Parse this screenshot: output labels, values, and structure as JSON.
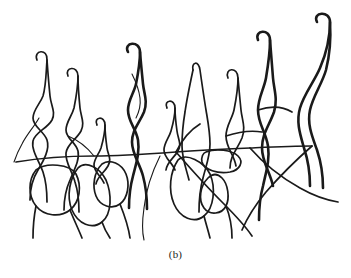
{
  "figure": {
    "caption": "(b)",
    "kind": "line-drawing",
    "background_color": "#ffffff",
    "ink_color": "#1a1a1a",
    "canvas": {
      "width": 351,
      "height": 278
    },
    "drawing_bounds": {
      "x": 14,
      "y": 18,
      "width": 326,
      "height": 222
    }
  },
  "chart_data": {
    "type": "line",
    "title": "(b)",
    "xlabel": "",
    "ylabel": "",
    "grid": false,
    "legend": null,
    "xlim": [
      0,
      351
    ],
    "ylim": [
      278,
      0
    ],
    "stroke_color": "#1a1a1a",
    "stroke_widths": {
      "thin": 1.1,
      "medium": 1.7,
      "thick": 2.6
    },
    "series": [
      {
        "name": "filament-1",
        "width": "medium",
        "points": "M37,60 C33,50 48,48 47,60 C46,74 46,86 43,96 C40,104 33,110 33,118 C33,127 44,131 47,140 C50,149 44,160 38,170 C33,178 30,188 30,200"
      },
      {
        "name": "filament-1b",
        "width": "medium",
        "points": "M47,60 C48,74 49,86 50,96 C51,106 56,112 52,120 C47,129 35,132 33,141 C31,150 39,161 43,172 C46,181 47,190 47,202"
      },
      {
        "name": "filament-1-tail",
        "width": "thin",
        "points": "M39,118 C34,127 27,134 22,144 C18,151 16,156 14,162"
      },
      {
        "name": "filament-2",
        "width": "medium",
        "points": "M68,76 C64,67 78,65 78,76 C78,88 76,98 74,108 C72,116 66,122 66,130 C66,139 76,142 78,151 C80,160 74,170 70,180 C66,189 64,198 64,210"
      },
      {
        "name": "filament-2b",
        "width": "medium",
        "points": "M78,76 C78,88 79,98 80,108 C81,117 85,123 81,131 C76,140 67,144 66,153 C65,162 72,171 75,182 C78,191 79,200 79,212"
      },
      {
        "name": "filament-3",
        "width": "medium",
        "points": "M97,125 C93,117 105,115 105,125 C105,134 103,141 101,148 C99,154 94,159 94,165 C94,172 101,176 104,183"
      },
      {
        "name": "filament-3b",
        "width": "medium",
        "points": "M105,125 C105,134 106,141 107,148 C108,155 112,159 108,166 C104,173 97,177 96,184"
      },
      {
        "name": "filament-4",
        "width": "thick",
        "points": "M128,52 C123,42 140,40 140,52 C140,64 138,74 136,84 C134,93 128,100 128,110 C128,122 136,128 138,140 C140,152 136,164 133,176 C130,187 129,196 129,208"
      },
      {
        "name": "filament-4b",
        "width": "thick",
        "points": "M140,52 C141,64 142,74 143,84 C144,94 148,101 144,112 C139,124 132,130 132,142 C132,154 140,164 143,176 C146,187 147,197 147,209"
      },
      {
        "name": "filament-4-inner",
        "width": "thin",
        "points": "M132,74 C136,82 139,90 140,98 C141,106 139,112 136,118"
      },
      {
        "name": "filament-5",
        "width": "medium",
        "points": "M167,108 C163,100 175,98 175,108 C175,117 173,124 171,131 C169,138 164,143 164,150 C164,158 172,162 175,170"
      },
      {
        "name": "filament-5b",
        "width": "medium",
        "points": "M175,108 C175,117 176,124 177,131 C178,139 182,144 178,151 C174,158 167,162 166,170"
      },
      {
        "name": "filament-6",
        "width": "medium",
        "points": "M193,70 C191,62 199,60 200,70 C202,84 204,98 206,110 C208,122 210,132 210,144 C210,156 206,166 203,178 C200,189 199,198 199,212"
      },
      {
        "name": "filament-6b",
        "width": "medium",
        "points": "M193,70 C190,84 187,98 185,112 C183,124 182,134 182,146 C182,158 186,168 189,180"
      },
      {
        "name": "filament-7",
        "width": "medium",
        "points": "M228,78 C224,68 238,66 238,78 C238,90 236,100 234,110 C232,119 226,126 226,136 C226,148 234,154 236,166"
      },
      {
        "name": "filament-7b",
        "width": "medium",
        "points": "M238,78 C239,90 240,100 241,110 C242,120 246,127 242,138 C237,150 230,156 230,168"
      },
      {
        "name": "filament-8",
        "width": "thick",
        "points": "M258,40 C254,30 270,28 270,40 C270,54 268,66 266,78 C264,89 258,98 258,110 C258,124 266,132 268,146 C270,160 266,172 263,186 C260,197 259,206 259,220"
      },
      {
        "name": "filament-8b",
        "width": "thick",
        "points": "M270,40 C271,54 272,66 273,78 C274,90 278,99 274,112 C269,126 262,134 262,148 C262,162 270,172 273,186"
      },
      {
        "name": "filament-9",
        "width": "thick",
        "points": "M317,22 C312,12 330,10 330,22 C330,38 326,54 320,68 C314,82 304,94 300,108 C296,122 300,134 304,148 C308,160 310,172 310,186"
      },
      {
        "name": "filament-9b",
        "width": "thick",
        "points": "M330,22 C331,38 330,54 326,70 C322,84 313,96 310,110 C307,124 312,136 317,150 C321,162 323,174 323,188"
      },
      {
        "name": "cell-edge-a",
        "width": "medium",
        "points": "M16,162 C40,158 66,156 94,156 C120,156 148,154 176,152"
      },
      {
        "name": "cell-edge-b",
        "width": "medium",
        "points": "M176,152 C200,150 224,149 250,148 C272,147 292,146 312,146"
      },
      {
        "name": "cell-1",
        "width": "medium",
        "points": "M36,170 C28,180 28,196 36,206 C44,216 60,218 70,210 C80,202 82,186 76,174 C70,164 46,162 36,170 Z"
      },
      {
        "name": "cell-2",
        "width": "medium",
        "points": "M78,168 C70,178 66,196 72,210 C78,224 92,230 102,222 C112,214 112,194 106,180 C100,168 86,160 78,168 Z"
      },
      {
        "name": "cell-3",
        "width": "medium",
        "points": "M102,164 C94,172 92,186 96,196 C100,206 112,210 120,204 C128,198 130,184 126,174 C122,164 110,158 102,164 Z"
      },
      {
        "name": "cell-4",
        "width": "medium",
        "points": "M178,160 C170,172 168,190 174,204 C180,218 194,224 204,216 C214,208 216,188 210,174 C204,162 186,152 178,160 Z"
      },
      {
        "name": "cell-5",
        "width": "medium",
        "points": "M206,152 C216,148 232,150 238,156 C244,162 240,170 230,172 C218,174 204,170 202,162 C201,157 203,153 206,152 Z"
      },
      {
        "name": "cell-6",
        "width": "medium",
        "points": "M208,178 C200,186 198,200 204,208 C210,216 222,214 226,206 C230,198 228,184 222,178 C217,173 212,174 208,178 Z"
      },
      {
        "name": "link-1",
        "width": "medium",
        "points": "M70,210 C74,220 78,228 82,238"
      },
      {
        "name": "link-2",
        "width": "medium",
        "points": "M36,206 C34,216 33,226 33,238"
      },
      {
        "name": "link-3",
        "width": "medium",
        "points": "M102,222 C104,228 106,232 110,238"
      },
      {
        "name": "link-4",
        "width": "medium",
        "points": "M120,204 C124,214 128,224 130,238"
      },
      {
        "name": "link-5",
        "width": "medium",
        "points": "M204,216 C206,224 208,230 210,238"
      },
      {
        "name": "link-6",
        "width": "medium",
        "points": "M226,206 C230,216 232,226 232,238"
      },
      {
        "name": "diagonal-1",
        "width": "medium",
        "points": "M176,152 C190,168 206,186 222,202 C234,214 244,224 252,236"
      },
      {
        "name": "diagonal-2",
        "width": "medium",
        "points": "M250,148 C264,164 282,178 300,188 C314,196 326,200 338,202"
      },
      {
        "name": "diagonal-3",
        "width": "medium",
        "points": "M312,146 C296,160 280,176 266,192 C256,204 248,216 242,230"
      },
      {
        "name": "diagonal-4",
        "width": "thin",
        "points": "M160,156 C152,172 146,190 144,208 C142,222 142,232 144,240"
      },
      {
        "name": "branch-1",
        "width": "medium",
        "points": "M176,152 C182,140 190,130 200,124"
      },
      {
        "name": "branch-2",
        "width": "medium",
        "points": "M226,136 C238,132 250,130 262,132"
      },
      {
        "name": "branch-3",
        "width": "medium",
        "points": "M258,110 C270,106 282,106 292,112"
      },
      {
        "name": "branch-4",
        "width": "thin",
        "points": "M94,156 C86,146 78,140 68,136"
      }
    ]
  }
}
